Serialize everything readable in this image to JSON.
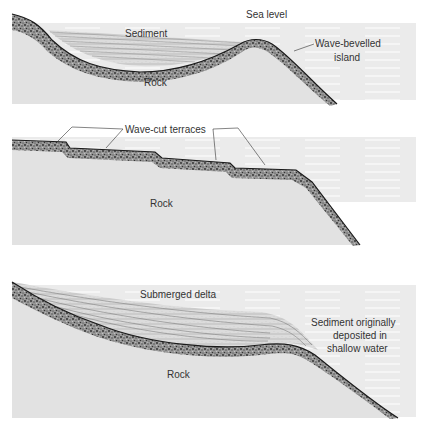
{
  "panels": [
    {
      "id": "island",
      "labels": {
        "sea_level": "Sea level",
        "sediment": "Sediment",
        "island_line1": "Wave-bevelled",
        "island_line2": "island",
        "rock": "Rock"
      }
    },
    {
      "id": "terraces",
      "labels": {
        "terraces": "Wave-cut terraces",
        "rock": "Rock"
      }
    },
    {
      "id": "delta",
      "labels": {
        "delta": "Submerged delta",
        "sed_line1": "Sediment originally",
        "sed_line2": "deposited in",
        "sed_line3": "shallow water",
        "rock": "Rock"
      }
    }
  ],
  "colors": {
    "water": "#ececec",
    "rock": "#e0e0e0",
    "gravel": "#6a6a6a",
    "sediment": "#d8d8d8",
    "line": "#222222"
  }
}
